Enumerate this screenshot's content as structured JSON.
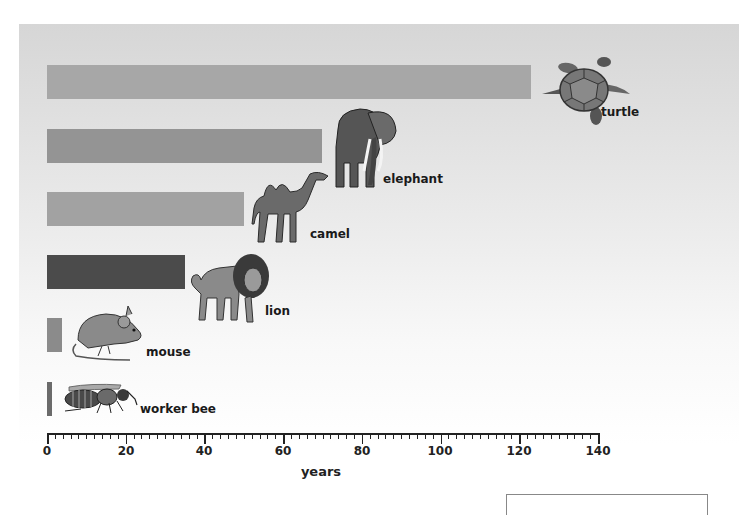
{
  "chart_data": {
    "type": "bar",
    "orientation": "horizontal",
    "title": "",
    "xlabel": "years",
    "ylabel": "",
    "xlim": [
      0,
      140
    ],
    "x_major_ticks": [
      0,
      20,
      40,
      60,
      80,
      100,
      120,
      140
    ],
    "x_minor_tick_step": 2,
    "grid": false,
    "legend": null,
    "categories": [
      "turtle",
      "elephant",
      "camel",
      "lion",
      "mouse",
      "worker bee"
    ],
    "values": [
      123,
      70,
      50,
      35,
      4,
      1
    ],
    "bar_colors": [
      "#a7a7a7",
      "#949494",
      "#a2a2a2",
      "#4b4b4b",
      "#8b8b8b",
      "#6b6b6b"
    ],
    "annotations": "Each bar is labeled with an illustration of the animal and its name at the bar's end."
  },
  "axis": {
    "tick_labels": [
      "0",
      "20",
      "40",
      "60",
      "80",
      "100",
      "120",
      "140"
    ],
    "xlabel": "years"
  },
  "bars": [
    {
      "label": "turtle",
      "value": 123,
      "color": "#a7a7a7",
      "icon": "turtle-icon"
    },
    {
      "label": "elephant",
      "value": 70,
      "color": "#949494",
      "icon": "elephant-icon"
    },
    {
      "label": "camel",
      "value": 50,
      "color": "#a2a2a2",
      "icon": "camel-icon"
    },
    {
      "label": "lion",
      "value": 35,
      "color": "#4b4b4b",
      "icon": "lion-icon"
    },
    {
      "label": "mouse",
      "value": 4,
      "color": "#8b8b8b",
      "icon": "mouse-icon"
    },
    {
      "label": "worker bee",
      "value": 1,
      "color": "#6b6b6b",
      "icon": "bee-icon"
    }
  ]
}
